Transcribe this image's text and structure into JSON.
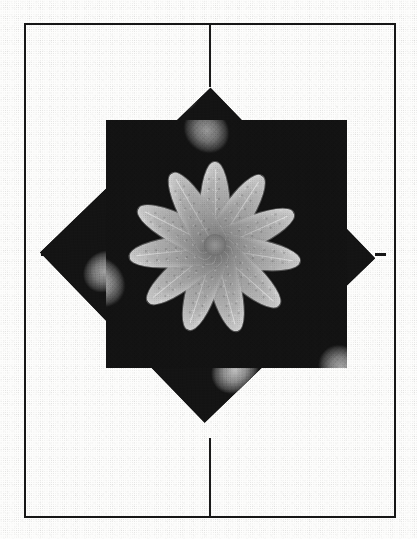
{
  "document": {
    "kind": "scanned-figure-page",
    "background_color": "#fdfdfc",
    "frame": {
      "name": "figure-border",
      "color": "#171717",
      "x": 24,
      "y": 23,
      "width": 372,
      "height": 495,
      "stroke": 2
    },
    "registration_marks": [
      {
        "name": "crop-mark-top",
        "orientation": "vertical",
        "x": 209,
        "y": 24,
        "length": 63,
        "thickness": 2,
        "color": "#1a1a1a"
      },
      {
        "name": "crop-mark-bottom",
        "orientation": "vertical",
        "x": 209,
        "y": 438,
        "length": 79,
        "thickness": 2,
        "color": "#1a1a1a"
      },
      {
        "name": "crop-mark-left",
        "orientation": "horizontal",
        "x": 41,
        "y": 253,
        "length": 21,
        "thickness": 3,
        "color": "#161616"
      },
      {
        "name": "crop-mark-right",
        "orientation": "horizontal",
        "x": 375,
        "y": 253,
        "length": 11,
        "thickness": 3,
        "color": "#161616"
      }
    ]
  },
  "figure": {
    "name": "electron-micrograph-collage",
    "color_mode": "grayscale",
    "panels": [
      {
        "name": "rotated-square-panel",
        "rotation_deg": -44,
        "vertices": [
          [
            185,
            90
          ],
          [
            368,
            240
          ],
          [
            232,
            420
          ],
          [
            47,
            268
          ]
        ],
        "background_color": "#101010"
      },
      {
        "name": "upright-square-panel",
        "rotation_deg": 0,
        "x": 106,
        "y": 120,
        "width": 241,
        "height": 248,
        "background_color": "#101010"
      }
    ],
    "rosette": {
      "name": "radial-blade-rosette",
      "center": [
        215,
        245
      ],
      "blade_count": 11,
      "blade_angles_deg": [
        0,
        33,
        66,
        99,
        132,
        165,
        198,
        231,
        264,
        297,
        330
      ],
      "blade_length_px": 86,
      "blade_width_px": 30,
      "highlight_color": "#c9c9c9",
      "shadow_color": "#6f6f6f"
    },
    "granule_field": {
      "name": "rounded-granule-texture",
      "granule_count": 15,
      "highlight_color": "#c2c2c2",
      "midtone_color": "#8a8a8a",
      "shadow_color": "#3a3a3a",
      "field_color": "#141414"
    }
  },
  "render": {
    "halftone_opacity": 0.22,
    "paper_grain_opacity": 0.3
  }
}
